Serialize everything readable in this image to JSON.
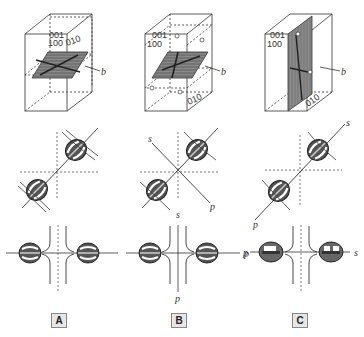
{
  "figure": {
    "columns": [
      {
        "id": "A",
        "label": "A",
        "crystal": {
          "face_labels": [
            "001",
            "100",
            "010"
          ],
          "axis_label": "b"
        },
        "middle": {
          "axis_labels": []
        },
        "bottom": {
          "axis_labels": []
        }
      },
      {
        "id": "B",
        "label": "B",
        "crystal": {
          "face_labels": [
            "001",
            "100",
            "010"
          ],
          "axis_label": "b"
        },
        "middle": {
          "axis_labels": [
            "s",
            "s",
            "p"
          ]
        },
        "bottom": {
          "axis_labels": [
            "p",
            "p"
          ]
        }
      },
      {
        "id": "C",
        "label": "C",
        "crystal": {
          "face_labels": [
            "001",
            "100",
            "010"
          ],
          "axis_label": "b"
        },
        "middle": {
          "axis_labels": [
            "s",
            "p"
          ]
        },
        "bottom": {
          "axis_labels": [
            "p",
            "s"
          ]
        }
      }
    ]
  }
}
